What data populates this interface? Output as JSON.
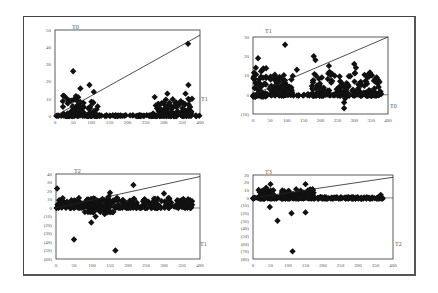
{
  "figure": {
    "panel_count": 4
  },
  "chart_data": [
    {
      "type": "scatter",
      "title": "T0",
      "xlabel": "",
      "ylabel": "",
      "right_label": "T1",
      "xlim": [
        0,
        400
      ],
      "ylim": [
        0,
        50
      ],
      "xticks": [
        0,
        50,
        100,
        150,
        200,
        250,
        300,
        350,
        400
      ],
      "yticks": [
        0,
        10,
        20,
        30,
        40,
        50
      ],
      "ytick_labels": [
        "0",
        "10",
        "20",
        "30",
        "40",
        "50"
      ],
      "reference_line": {
        "x": [
          0,
          400
        ],
        "y": [
          0,
          47
        ]
      },
      "grid": false,
      "marker": "diamond",
      "clusters": [
        {
          "x_range": [
            0,
            400
          ],
          "y_range": [
            0,
            0.5
          ],
          "count": 120
        },
        {
          "x_range": [
            20,
            80
          ],
          "y_range": [
            0,
            12
          ],
          "count": 60
        },
        {
          "x_range": [
            90,
            120
          ],
          "y_range": [
            0,
            9
          ],
          "count": 25
        },
        {
          "x_range": [
            270,
            380
          ],
          "y_range": [
            0,
            10
          ],
          "count": 90
        }
      ],
      "points": [
        [
          50,
          26
        ],
        [
          95,
          18
        ],
        [
          70,
          16
        ],
        [
          107,
          14
        ],
        [
          367,
          42
        ],
        [
          368,
          18
        ],
        [
          310,
          13
        ],
        [
          275,
          11
        ],
        [
          360,
          13
        ],
        [
          378,
          10
        ]
      ]
    },
    {
      "type": "scatter",
      "title": "T1",
      "xlabel": "",
      "ylabel": "",
      "right_label": "T0",
      "xlim": [
        0,
        400
      ],
      "ylim": [
        -10,
        30
      ],
      "xticks": [
        0,
        50,
        100,
        150,
        200,
        250,
        300,
        350,
        400
      ],
      "yticks": [
        -10,
        0,
        10,
        20,
        30
      ],
      "ytick_labels": [
        "(10)",
        "0",
        "10",
        "20",
        "30"
      ],
      "reference_line": {
        "x": [
          0,
          400
        ],
        "y": [
          0,
          30
        ]
      },
      "grid": false,
      "marker": "diamond",
      "clusters": [
        {
          "x_range": [
            0,
            380
          ],
          "y_range": [
            -0.5,
            0.5
          ],
          "count": 120
        },
        {
          "x_range": [
            0,
            40
          ],
          "y_range": [
            -1,
            15
          ],
          "count": 60
        },
        {
          "x_range": [
            50,
            120
          ],
          "y_range": [
            0,
            11
          ],
          "count": 70
        },
        {
          "x_range": [
            170,
            380
          ],
          "y_range": [
            0,
            12
          ],
          "count": 160
        }
      ],
      "points": [
        [
          95,
          26
        ],
        [
          15,
          19
        ],
        [
          180,
          20
        ],
        [
          185,
          18
        ],
        [
          225,
          15
        ],
        [
          300,
          16
        ],
        [
          305,
          14
        ],
        [
          130,
          13
        ],
        [
          270,
          -4
        ],
        [
          270,
          -7
        ],
        [
          273,
          -2
        ]
      ]
    },
    {
      "type": "scatter",
      "title": "T2",
      "xlabel": "",
      "ylabel": "",
      "right_label": "T1",
      "xlim": [
        0,
        400
      ],
      "ylim": [
        -60,
        40
      ],
      "xticks": [
        0,
        50,
        100,
        150,
        200,
        250,
        300,
        350,
        400
      ],
      "yticks": [
        -60,
        -50,
        -40,
        -30,
        -20,
        -10,
        0,
        10,
        20,
        30,
        40
      ],
      "ytick_labels": [
        "(60)",
        "(50)",
        "(40)",
        "(30)",
        "(20)",
        "(10)",
        "0",
        "10",
        "20",
        "30",
        "40"
      ],
      "reference_line": {
        "x": [
          0,
          400
        ],
        "y": [
          0,
          37
        ]
      },
      "grid": false,
      "marker": "diamond",
      "clusters": [
        {
          "x_range": [
            0,
            380
          ],
          "y_range": [
            0,
            12
          ],
          "count": 260
        },
        {
          "x_range": [
            80,
            160
          ],
          "y_range": [
            -5,
            15
          ],
          "count": 60
        }
      ],
      "points": [
        [
          3,
          23
        ],
        [
          215,
          27
        ],
        [
          300,
          17
        ],
        [
          150,
          18
        ],
        [
          50,
          -37
        ],
        [
          98,
          -17
        ],
        [
          110,
          -10
        ],
        [
          135,
          -7
        ],
        [
          165,
          -50
        ]
      ]
    },
    {
      "type": "scatter",
      "title": "T3",
      "xlabel": "",
      "ylabel": "",
      "right_label": "T2",
      "xlim": [
        0,
        400
      ],
      "ylim": [
        -80,
        30
      ],
      "xticks": [
        0,
        50,
        100,
        150,
        200,
        250,
        300,
        350,
        400
      ],
      "yticks": [
        -80,
        -70,
        -60,
        -50,
        -40,
        -30,
        -20,
        -10,
        0,
        10,
        20,
        30
      ],
      "ytick_labels": [
        "(80)",
        "(70)",
        "(60)",
        "(50)",
        "(40)",
        "(30)",
        "(20)",
        "(10)",
        "0",
        "10",
        "20",
        "30"
      ],
      "reference_line": {
        "x": [
          0,
          400
        ],
        "y": [
          0,
          27
        ]
      },
      "grid": false,
      "marker": "diamond",
      "clusters": [
        {
          "x_range": [
            0,
            375
          ],
          "y_range": [
            -1,
            1
          ],
          "count": 180
        },
        {
          "x_range": [
            15,
            60
          ],
          "y_range": [
            0,
            14
          ],
          "count": 40
        },
        {
          "x_range": [
            80,
            175
          ],
          "y_range": [
            0,
            12
          ],
          "count": 80
        }
      ],
      "points": [
        [
          50,
          18
        ],
        [
          150,
          18
        ],
        [
          48,
          -12
        ],
        [
          70,
          -30
        ],
        [
          110,
          -20
        ],
        [
          150,
          -19
        ],
        [
          113,
          -70
        ],
        [
          365,
          4
        ]
      ]
    }
  ]
}
